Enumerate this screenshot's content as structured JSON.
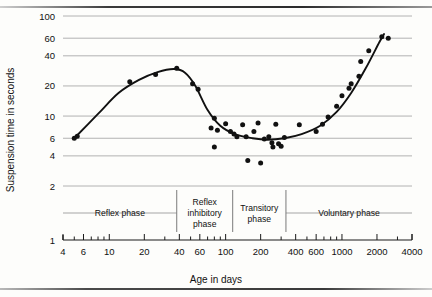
{
  "figure": {
    "title": "",
    "xlabel": "Age in days",
    "ylabel": "Suspension time in seconds"
  },
  "chart_data": {
    "type": "scatter",
    "title": "",
    "xlabel": "Age in days",
    "ylabel": "Suspension time in seconds",
    "xscale": "log",
    "yscale": "log",
    "xlim": [
      4,
      4000
    ],
    "ylim": [
      1,
      100
    ],
    "grid": true,
    "legend": "none",
    "xticks": [
      4,
      6,
      10,
      20,
      40,
      60,
      100,
      200,
      400,
      600,
      1000,
      2000,
      4000
    ],
    "xtick_labels": [
      "4",
      "6",
      "10",
      "20",
      "40",
      "60",
      "100",
      "200",
      "400",
      "600",
      "1000",
      "2000",
      "4000"
    ],
    "yticks": [
      1,
      2,
      4,
      6,
      10,
      20,
      40,
      60,
      100
    ],
    "ytick_labels": [
      "1",
      "2",
      "4",
      "6",
      "10",
      "20",
      "40",
      "60",
      "100"
    ],
    "points": [
      {
        "x": 5,
        "y": 6.0
      },
      {
        "x": 5.3,
        "y": 6.3
      },
      {
        "x": 15,
        "y": 22
      },
      {
        "x": 25,
        "y": 26
      },
      {
        "x": 38,
        "y": 30
      },
      {
        "x": 52,
        "y": 21
      },
      {
        "x": 58,
        "y": 18.5
      },
      {
        "x": 80,
        "y": 9.5
      },
      {
        "x": 75,
        "y": 7.6
      },
      {
        "x": 85,
        "y": 7.2
      },
      {
        "x": 80,
        "y": 4.9
      },
      {
        "x": 100,
        "y": 8.4
      },
      {
        "x": 110,
        "y": 7.0
      },
      {
        "x": 118,
        "y": 6.6
      },
      {
        "x": 125,
        "y": 6.2
      },
      {
        "x": 140,
        "y": 8.2
      },
      {
        "x": 150,
        "y": 6.2
      },
      {
        "x": 155,
        "y": 3.6
      },
      {
        "x": 175,
        "y": 7.0
      },
      {
        "x": 190,
        "y": 8.5
      },
      {
        "x": 200,
        "y": 3.4
      },
      {
        "x": 215,
        "y": 5.9
      },
      {
        "x": 235,
        "y": 6.2
      },
      {
        "x": 250,
        "y": 5.4
      },
      {
        "x": 255,
        "y": 4.9
      },
      {
        "x": 270,
        "y": 8.3
      },
      {
        "x": 285,
        "y": 5.3
      },
      {
        "x": 300,
        "y": 5.0
      },
      {
        "x": 320,
        "y": 6.1
      },
      {
        "x": 430,
        "y": 8.2
      },
      {
        "x": 600,
        "y": 7.0
      },
      {
        "x": 680,
        "y": 8.3
      },
      {
        "x": 760,
        "y": 9.8
      },
      {
        "x": 900,
        "y": 12.5
      },
      {
        "x": 1000,
        "y": 16
      },
      {
        "x": 1150,
        "y": 19
      },
      {
        "x": 1200,
        "y": 21
      },
      {
        "x": 1400,
        "y": 25
      },
      {
        "x": 1450,
        "y": 35
      },
      {
        "x": 1700,
        "y": 45
      },
      {
        "x": 2200,
        "y": 62
      },
      {
        "x": 2500,
        "y": 60
      }
    ],
    "fitted_curve": [
      {
        "x": 5,
        "y": 6.0
      },
      {
        "x": 8,
        "y": 10.5
      },
      {
        "x": 12,
        "y": 17
      },
      {
        "x": 18,
        "y": 23
      },
      {
        "x": 26,
        "y": 27.5
      },
      {
        "x": 36,
        "y": 29.5
      },
      {
        "x": 45,
        "y": 27
      },
      {
        "x": 55,
        "y": 20
      },
      {
        "x": 70,
        "y": 11.5
      },
      {
        "x": 90,
        "y": 8.0
      },
      {
        "x": 120,
        "y": 6.6
      },
      {
        "x": 170,
        "y": 6.0
      },
      {
        "x": 230,
        "y": 5.8
      },
      {
        "x": 320,
        "y": 6.0
      },
      {
        "x": 450,
        "y": 6.6
      },
      {
        "x": 650,
        "y": 8.0
      },
      {
        "x": 900,
        "y": 11
      },
      {
        "x": 1200,
        "y": 17
      },
      {
        "x": 1600,
        "y": 30
      },
      {
        "x": 2100,
        "y": 55
      },
      {
        "x": 2300,
        "y": 66
      }
    ],
    "annotations": [
      {
        "label": "Reflex phase",
        "x_start": 4,
        "x_end": 38
      },
      {
        "label": "Reflex inhibitory phase",
        "x_start": 38,
        "x_end": 115
      },
      {
        "label": "Transitory phase",
        "x_start": 115,
        "x_end": 330
      },
      {
        "label": "Voluntary phase",
        "x_start": 330,
        "x_end": 4000
      }
    ],
    "phase_dividers": [
      38,
      115,
      330
    ]
  }
}
